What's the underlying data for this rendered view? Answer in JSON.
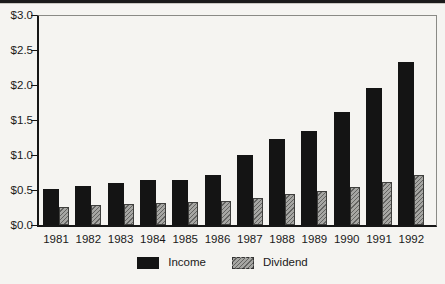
{
  "page": {
    "background": "#f5f4f1",
    "top_rule_color": "#1b1b1b"
  },
  "chart_data": {
    "type": "bar",
    "title": "",
    "categories": [
      "1981",
      "1982",
      "1983",
      "1984",
      "1985",
      "1986",
      "1987",
      "1988",
      "1989",
      "1990",
      "1991",
      "1992"
    ],
    "series": [
      {
        "name": "Income",
        "style": "solid-black",
        "color": "#141414",
        "values": [
          0.51,
          0.56,
          0.6,
          0.64,
          0.65,
          0.71,
          1.0,
          1.23,
          1.35,
          1.61,
          1.96,
          2.33
        ]
      },
      {
        "name": "Dividend",
        "style": "diagonal-hatch",
        "color": "#a6a6a3",
        "hatch_color": "#636361",
        "values": [
          0.26,
          0.28,
          0.3,
          0.31,
          0.33,
          0.35,
          0.38,
          0.44,
          0.48,
          0.55,
          0.62,
          0.72
        ]
      }
    ],
    "xlabel": "",
    "ylabel": "",
    "ylim": [
      0,
      3.0
    ],
    "ytick_step": 0.5,
    "ytick_labels": [
      "$3.0",
      "$2.5",
      "$2.0",
      "$1.5",
      "$1.0",
      "$0.5",
      "$0.0"
    ],
    "grid": false,
    "legend_position": "bottom"
  }
}
